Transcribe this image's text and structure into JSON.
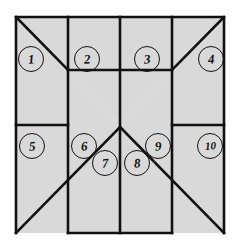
{
  "figure": {
    "canvas": {
      "width": 239,
      "height": 250
    },
    "colors": {
      "background": "#ffffff",
      "region_fill": "#d9d9d9",
      "outline": "#111111",
      "label_text": "#111111"
    },
    "geometry": {
      "outer_rect": {
        "left": 16,
        "top": 17,
        "right": 224,
        "bottom": 233
      },
      "center_column": {
        "left": 68,
        "right": 172,
        "top": 17,
        "bottom": 233
      },
      "eave_line_y": 125,
      "ridge_line_y": 70,
      "valley_apex": {
        "x": 120,
        "y": 127
      },
      "stroke_width": 2.6
    },
    "regions": [
      {
        "id": 1,
        "label": "1",
        "name": "top-left-hip",
        "cx": 30,
        "cy": 58
      },
      {
        "id": 2,
        "label": "2",
        "name": "top-left-slope",
        "cx": 86,
        "cy": 58
      },
      {
        "id": 3,
        "label": "3",
        "name": "top-right-slope",
        "cx": 146,
        "cy": 58
      },
      {
        "id": 4,
        "label": "4",
        "name": "top-right-hip",
        "cx": 210,
        "cy": 58
      },
      {
        "id": 5,
        "label": "5",
        "name": "lower-left-wing",
        "cx": 31,
        "cy": 145
      },
      {
        "id": 6,
        "label": "6",
        "name": "left-valley-upper",
        "cx": 83,
        "cy": 145
      },
      {
        "id": 7,
        "label": "7",
        "name": "left-valley-lower",
        "cx": 104,
        "cy": 162
      },
      {
        "id": 8,
        "label": "8",
        "name": "right-valley-lower",
        "cx": 136,
        "cy": 162
      },
      {
        "id": 9,
        "label": "9",
        "name": "right-valley-upper",
        "cx": 157,
        "cy": 145
      },
      {
        "id": 10,
        "label": "10",
        "name": "lower-right-wing",
        "cx": 209,
        "cy": 145
      }
    ]
  }
}
